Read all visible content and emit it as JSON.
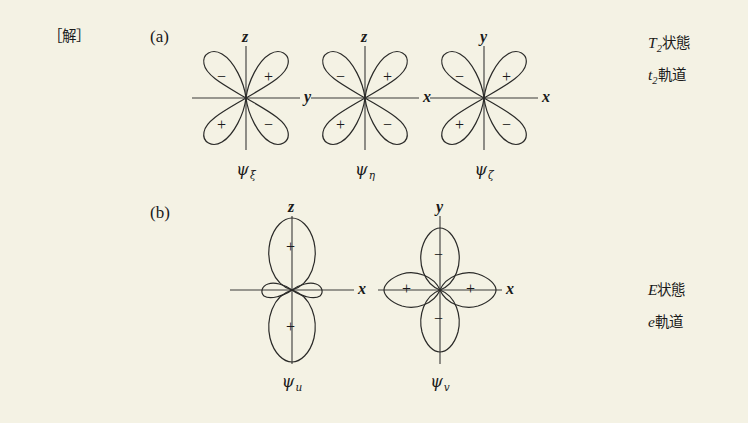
{
  "page": {
    "solution_marker": "［解］",
    "background_color": "#f4f2e4",
    "ink_color": "#1a1a1a"
  },
  "sections": [
    {
      "key": "a",
      "label": "(a)",
      "side_state": {
        "symbol": "T",
        "subscript": "2",
        "word": "状態"
      },
      "side_orbital": {
        "symbol": "t",
        "subscript": "2",
        "word": "軌道"
      }
    },
    {
      "key": "b",
      "label": "(b)",
      "side_state": {
        "symbol": "E",
        "subscript": "",
        "word": "状態"
      },
      "side_orbital": {
        "symbol": "e",
        "subscript": "",
        "word": "軌道"
      }
    }
  ],
  "orbitals": [
    {
      "id": "psi-xi",
      "section": "a",
      "type": "cloverleaf-diagonal",
      "caption_symbol": "ψ",
      "caption_subscript": "ξ",
      "vertical_axis_label": "z",
      "horizontal_axis_label": "y",
      "lobe_signs": {
        "top_left": "−",
        "top_right": "+",
        "bottom_left": "+",
        "bottom_right": "−"
      }
    },
    {
      "id": "psi-eta",
      "section": "a",
      "type": "cloverleaf-diagonal",
      "caption_symbol": "ψ",
      "caption_subscript": "η",
      "vertical_axis_label": "z",
      "horizontal_axis_label": "x",
      "lobe_signs": {
        "top_left": "−",
        "top_right": "+",
        "bottom_left": "+",
        "bottom_right": "−"
      }
    },
    {
      "id": "psi-zeta",
      "section": "a",
      "type": "cloverleaf-diagonal",
      "caption_symbol": "ψ",
      "caption_subscript": "ζ",
      "vertical_axis_label": "y",
      "horizontal_axis_label": "x",
      "lobe_signs": {
        "top_left": "−",
        "top_right": "+",
        "bottom_left": "+",
        "bottom_right": "−"
      }
    },
    {
      "id": "psi-u",
      "section": "b",
      "type": "dz2",
      "caption_symbol": "ψ",
      "caption_subscript": "u",
      "vertical_axis_label": "z",
      "horizontal_axis_label": "x",
      "lobe_signs": {
        "top": "+",
        "bottom": "+",
        "left": "",
        "right": ""
      }
    },
    {
      "id": "psi-v",
      "section": "b",
      "type": "dx2y2",
      "caption_symbol": "ψ",
      "caption_subscript": "v",
      "vertical_axis_label": "y",
      "horizontal_axis_label": "x",
      "lobe_signs": {
        "top": "−",
        "bottom": "−",
        "left": "+",
        "right": "+"
      }
    }
  ]
}
